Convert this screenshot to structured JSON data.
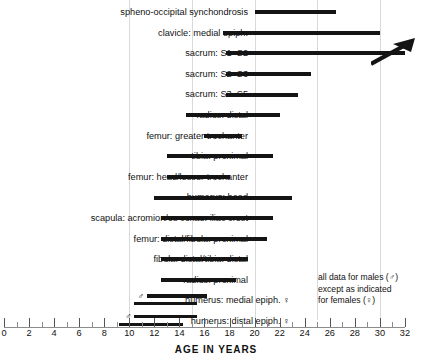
{
  "chart_data": {
    "type": "bar",
    "orientation": "horizontal",
    "title": "",
    "xlabel": "AGE IN YEARS",
    "ylabel": "",
    "xlim": [
      0,
      32
    ],
    "xticks": [
      0,
      2,
      4,
      6,
      8,
      10,
      12,
      14,
      16,
      18,
      20,
      22,
      24,
      26,
      28,
      30,
      32
    ],
    "minor_tick_step": 1,
    "grid": true,
    "gridlines": [
      10,
      15,
      20,
      25,
      30
    ],
    "legend_position": "bottom-right",
    "categories": [
      "spheno-occipital synchondrosis",
      "clavicle: medial epiph.",
      "sacrum: S1–S2",
      "sacrum: S2–S3",
      "sacrum: S3–S5",
      "radius: distal",
      "femur: greater trochanter",
      "tibia: proximal",
      "femur: head/lesser trochanter",
      "humerus: head",
      "scapula: acromion/os coxae: iliac crest",
      "femur: distal/fibula: proximal",
      "fibula: distal/tibia: distal",
      "radius: proximal",
      "humerus: medial epiph.",
      "humerus: distal epiph."
    ],
    "bars": [
      {
        "label": "spheno-occipital synchondrosis",
        "start": 20.0,
        "end": 26.5,
        "sex": "male",
        "open_ended": false
      },
      {
        "label": "clavicle: medial epiph.",
        "start": 17.5,
        "end": 30.0,
        "sex": "male",
        "open_ended": false
      },
      {
        "label": "sacrum: S1–S2",
        "start": 17.7,
        "end": 32.0,
        "sex": "male",
        "open_ended": true
      },
      {
        "label": "sacrum: S2–S3",
        "start": 17.7,
        "end": 24.5,
        "sex": "male",
        "open_ended": false
      },
      {
        "label": "sacrum: S3–S5",
        "start": 17.7,
        "end": 23.5,
        "sex": "male",
        "open_ended": false
      },
      {
        "label": "radius: distal",
        "start": 14.5,
        "end": 22.0,
        "sex": "male",
        "open_ended": false
      },
      {
        "label": "femur: greater trochanter",
        "start": 16.0,
        "end": 19.0,
        "sex": "male",
        "open_ended": false
      },
      {
        "label": "tibia: proximal",
        "start": 13.0,
        "end": 21.5,
        "sex": "male",
        "open_ended": false
      },
      {
        "label": "femur: head/lesser trochanter",
        "start": 13.0,
        "end": 18.0,
        "sex": "male",
        "open_ended": false
      },
      {
        "label": "humerus: head",
        "start": 12.0,
        "end": 23.0,
        "sex": "male",
        "open_ended": false
      },
      {
        "label": "scapula: acromion/os coxae: iliac crest",
        "start": 12.5,
        "end": 21.5,
        "sex": "male",
        "open_ended": false
      },
      {
        "label": "femur: distal/fibula: proximal",
        "start": 12.5,
        "end": 21.0,
        "sex": "male",
        "open_ended": false
      },
      {
        "label": "fibula: distal/tibia: distal",
        "start": 12.5,
        "end": 19.5,
        "sex": "male",
        "open_ended": false
      },
      {
        "label": "radius: proximal",
        "start": 12.5,
        "end": 18.5,
        "sex": "male",
        "open_ended": false
      },
      {
        "label": "humerus: medial epiph.",
        "start": 11.4,
        "end": 16.2,
        "sex": "male",
        "open_ended": false
      },
      {
        "label": "humerus: medial epiph.",
        "start": 10.4,
        "end": 15.4,
        "sex": "female",
        "open_ended": false
      },
      {
        "label": "humerus: distal epiph.",
        "start": 10.4,
        "end": 15.4,
        "sex": "male",
        "open_ended": false
      },
      {
        "label": "humerus: distal epiph.",
        "start": 9.2,
        "end": 14.3,
        "sex": "female",
        "open_ended": false
      }
    ]
  },
  "rows": [
    {
      "label": "spheno-occipital synchondrosis",
      "sex_marks": []
    },
    {
      "label": "clavicle: medial epiph.",
      "sex_marks": []
    },
    {
      "label": "sacrum: S1–S2",
      "sex_marks": []
    },
    {
      "label": "sacrum: S2–S3",
      "sex_marks": []
    },
    {
      "label": "sacrum: S3–S5",
      "sex_marks": []
    },
    {
      "label": "radius: distal",
      "sex_marks": []
    },
    {
      "label": "femur: greater trochanter",
      "sex_marks": []
    },
    {
      "label": "tibia: proximal",
      "sex_marks": []
    },
    {
      "label": "femur: head/lesser trochanter",
      "sex_marks": []
    },
    {
      "label": "humerus: head",
      "sex_marks": []
    },
    {
      "label": "scapula: acromion/os coxae: iliac crest",
      "sex_marks": []
    },
    {
      "label": "femur: distal/fibula: proximal",
      "sex_marks": []
    },
    {
      "label": "fibula: distal/tibia: distal",
      "sex_marks": []
    },
    {
      "label": "radius: proximal",
      "sex_marks": []
    },
    {
      "label": "humerus: medial epiph.  ♀",
      "sex_marks": [
        "♂"
      ]
    },
    {
      "label": "humerus: distal epiph.  ♀",
      "sex_marks": [
        "♂"
      ]
    }
  ],
  "axis": {
    "title": "AGE IN YEARS",
    "tick_labels": [
      "0",
      "2",
      "4",
      "6",
      "8",
      "10",
      "12",
      "14",
      "16",
      "18",
      "20",
      "22",
      "24",
      "26",
      "28",
      "30",
      "32"
    ]
  },
  "legend": {
    "line1": "all data for males (♂)",
    "line2": "except as indicated",
    "line3": "for females (♀)"
  },
  "colors": {
    "bar": "#141414",
    "grid": "#d9d9d9",
    "tick": "#6e6e6e",
    "text": "#111111",
    "background": "#ffffff"
  }
}
